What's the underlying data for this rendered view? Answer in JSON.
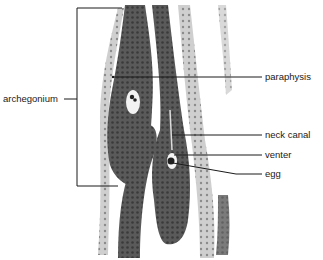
{
  "figure": {
    "labels": {
      "archegonium": "archegonium",
      "paraphysis": "paraphysis",
      "neck_canal": "neck canal",
      "venter": "venter",
      "egg": "egg"
    },
    "colors": {
      "background": "#ffffff",
      "tissue_dark": "#4a4a4a",
      "tissue_mid": "#8a8a8a",
      "tissue_light": "#c8c8c8",
      "line": "#1a1a1a"
    }
  }
}
